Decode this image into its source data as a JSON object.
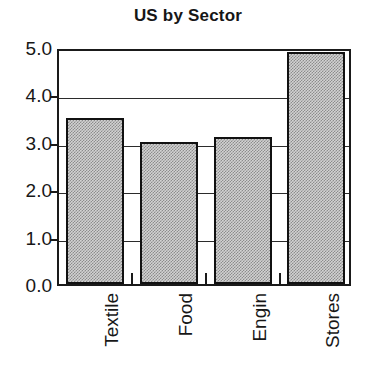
{
  "chart_data": {
    "type": "bar",
    "title": "US by Sector",
    "xlabel": "",
    "ylabel": "",
    "categories": [
      "Textile",
      "Food",
      "Engin",
      "Stores"
    ],
    "values": [
      3.5,
      3.0,
      3.1,
      4.9
    ],
    "ylim": [
      0.0,
      5.0
    ],
    "ytick_labels": [
      "0.0",
      "1.0",
      "2.0",
      "3.0",
      "4.0",
      "5.0"
    ],
    "ytick_values": [
      0.0,
      1.0,
      2.0,
      3.0,
      4.0,
      5.0
    ],
    "grid": true,
    "legend": false,
    "bar_fill": "#c8c8c8",
    "bar_edge": "#111111",
    "axis_color": "#1a1a1a"
  }
}
